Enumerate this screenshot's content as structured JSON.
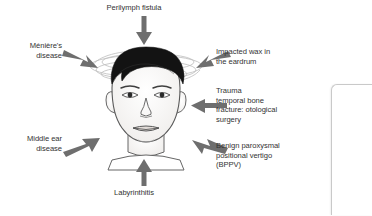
{
  "diagram": {
    "type": "medical-illustration",
    "center_figure": "human-head-with-dizziness-swirls",
    "colors": {
      "arrow": "#6e6e6e",
      "text": "#333333",
      "hair": "#111111",
      "skin_outline": "#555555",
      "swirl": "#b8b8b8",
      "panel_border": "#c9c9c9",
      "background": "#ffffff"
    },
    "labels": {
      "perilymph_fistula": "Perilymph fistula",
      "menieres_disease": "Ménière's\ndisease",
      "middle_ear_disease": "Middle ear\ndisease",
      "labyrinthitis": "Labyrinthitis",
      "impacted_wax": "Impacted wax in\nthe eardrum",
      "trauma": "Trauma\ntemporal bone\nfracture: otological\nsurgery",
      "bppv": "Benign paroxysmal\npositional vertigo\n(BPPV)"
    },
    "arrows": [
      {
        "name": "arrow-perilymph-fistula",
        "direction": "down",
        "points_to": "top-of-head"
      },
      {
        "name": "arrow-menieres-disease",
        "direction": "down-right",
        "points_to": "left-side-of-head"
      },
      {
        "name": "arrow-middle-ear-disease",
        "direction": "up-right",
        "points_to": "lower-left-of-head"
      },
      {
        "name": "arrow-labyrinthitis",
        "direction": "up",
        "points_to": "chin"
      },
      {
        "name": "arrow-impacted-wax",
        "direction": "down-left",
        "points_to": "right-side-of-head"
      },
      {
        "name": "arrow-trauma",
        "direction": "left",
        "points_to": "right-ear"
      },
      {
        "name": "arrow-bppv",
        "direction": "up-left",
        "points_to": "lower-right-of-head"
      }
    ]
  }
}
